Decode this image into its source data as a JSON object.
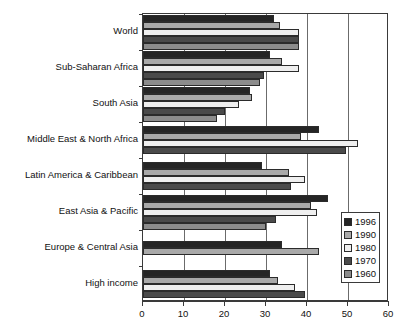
{
  "chart_data": {
    "type": "bar",
    "orientation": "horizontal",
    "title": "",
    "xlabel": "",
    "ylabel": "",
    "xlim": [
      0,
      60
    ],
    "xticks": [
      0,
      10,
      20,
      30,
      40,
      50,
      60
    ],
    "xtick_labels": [
      "0",
      "10",
      "20",
      "30",
      "40",
      "50",
      "60"
    ],
    "grid": true,
    "grid_axis": "x",
    "legend_position": "right-inside",
    "categories": [
      "World",
      "Sub-Saharan Africa",
      "South Asia",
      "Middle East & North Africa",
      "Latin America & Caribbean",
      "East Asia & Pacific",
      "Europe & Central Asia",
      "High income"
    ],
    "series": [
      {
        "name": "1996",
        "color": "#252525",
        "values": [
          32,
          31,
          26,
          43,
          29,
          45,
          34,
          31
        ]
      },
      {
        "name": "1990",
        "color": "#a9a9a9",
        "values": [
          33.5,
          34,
          26.5,
          38.5,
          35.5,
          41,
          43,
          33
        ]
      },
      {
        "name": "1980",
        "color": "#efefef",
        "values": [
          38,
          38,
          23.5,
          52.5,
          39.5,
          42.5,
          null,
          37
        ]
      },
      {
        "name": "1970",
        "color": "#4a4a4a",
        "values": [
          38,
          29.5,
          20,
          49.5,
          36,
          32.5,
          null,
          39.5
        ]
      },
      {
        "name": "1960",
        "color": "#8c8c8c",
        "values": [
          38,
          28.5,
          18,
          null,
          null,
          30,
          null,
          null
        ]
      }
    ]
  },
  "legend": {
    "entries": [
      {
        "label": "1996",
        "color": "#252525"
      },
      {
        "label": "1990",
        "color": "#a9a9a9"
      },
      {
        "label": "1980",
        "color": "#efefef"
      },
      {
        "label": "1970",
        "color": "#4a4a4a"
      },
      {
        "label": "1960",
        "color": "#8c8c8c"
      }
    ]
  }
}
